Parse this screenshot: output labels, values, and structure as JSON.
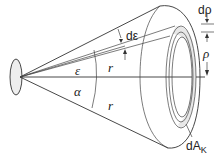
{
  "diagram": {
    "type": "solid-angle-cone",
    "labels": {
      "d_epsilon": "dε",
      "epsilon": "ε",
      "alpha": "α",
      "r_upper": "r",
      "r_lower": "r",
      "d_rho": "dρ",
      "rho": "ρ",
      "dA_prefix": "dA",
      "dA_sub": "K"
    },
    "colors": {
      "stroke": "#333333",
      "source_fill": "#eeeeee",
      "ring_fill": "#e8e8e8",
      "background": "#ffffff"
    }
  }
}
